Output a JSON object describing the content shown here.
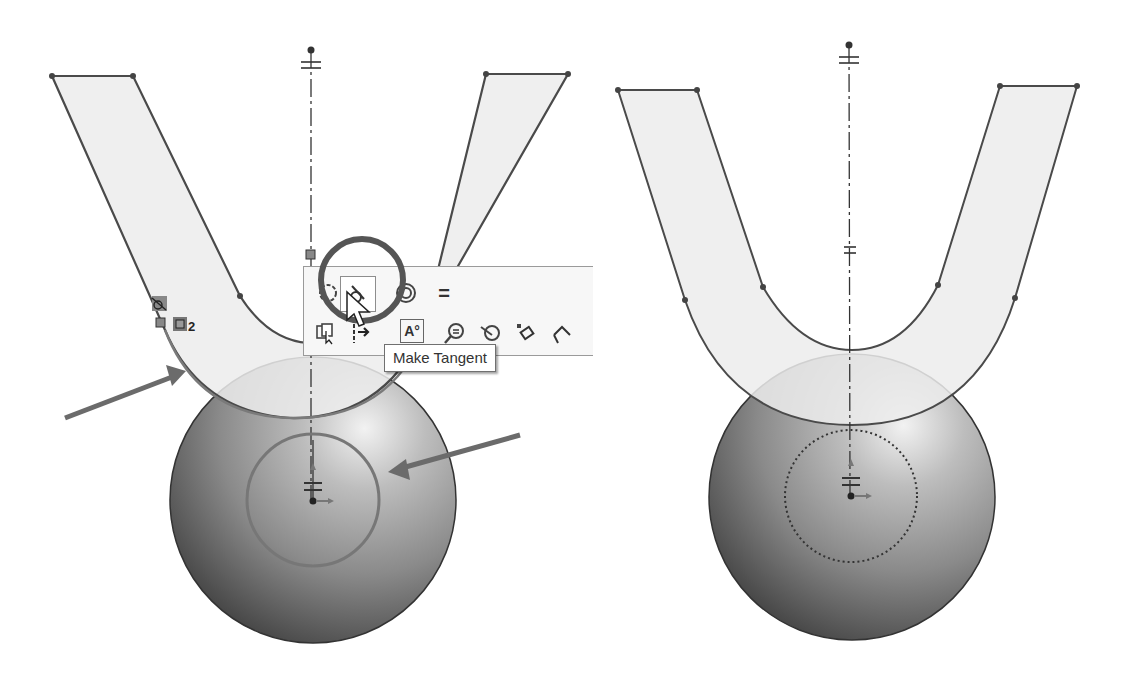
{
  "figures": {
    "left": {
      "label": "before-relation",
      "toolbar": {
        "row1": [
          {
            "icon": "coradial-icon",
            "label": "Coradial"
          },
          {
            "icon": "tangent-icon",
            "label": "Make Tangent",
            "selected": true
          },
          {
            "icon": "concentric-icon",
            "label": "Concentric"
          },
          {
            "icon": "equal-icon",
            "label": "=",
            "text": "="
          }
        ],
        "row2": [
          {
            "icon": "select-chain-icon"
          },
          {
            "icon": "construction-geometry-icon"
          },
          {
            "icon": "smart-dimension-icon",
            "text": "A°"
          },
          {
            "icon": "display-relations-icon"
          },
          {
            "icon": "repair-sketch-icon"
          },
          {
            "icon": "add-relation-icon"
          },
          {
            "icon": "fully-define-icon"
          }
        ],
        "tooltip": "Make Tangent"
      },
      "relation_badge_count": "2",
      "annotations": [
        "arrow-to-arc",
        "arrow-to-circle"
      ]
    },
    "right": {
      "label": "after-relation"
    }
  },
  "colors": {
    "sketch_line": "#4a4a4a",
    "profile_fill": "#ececec",
    "arrow": "#6b6b6b",
    "sphere_dark": "#4f4f4f",
    "sphere_light": "#e8e8e8"
  }
}
